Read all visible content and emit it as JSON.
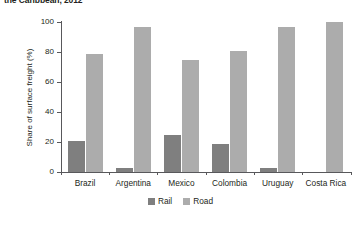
{
  "chart_data": {
    "type": "bar",
    "title": "the Caribbean, 2012",
    "xlabel": "",
    "ylabel": "Share of surface freight (%)",
    "ylim": [
      0,
      100
    ],
    "yticks": [
      0,
      20,
      40,
      60,
      80,
      100
    ],
    "grid": false,
    "legend_position": "bottom-center",
    "categories": [
      "Brazil",
      "Argentina",
      "Mexico",
      "Colombia",
      "Uruguay",
      "Costa Rica"
    ],
    "series": [
      {
        "name": "Rail",
        "color": "#7f7f7f",
        "values": [
          21,
          3,
          25,
          19,
          3,
          0
        ]
      },
      {
        "name": "Road",
        "color": "#acacac",
        "values": [
          79,
          97,
          75,
          81,
          97,
          100
        ]
      }
    ]
  },
  "colors": {
    "rail": "#7f7f7f",
    "road": "#acacac",
    "axis": "#58585b",
    "text": "#231f20",
    "background": "#ffffff"
  }
}
